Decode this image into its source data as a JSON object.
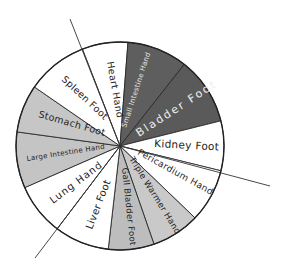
{
  "chart_data": {
    "type": "pie",
    "title": "",
    "center": [
      120,
      146
    ],
    "radius": 104,
    "segments": [
      {
        "label": "Heart Hand",
        "start": 248.8,
        "end": 274.4,
        "fill": "#ffffff",
        "text": "#222222"
      },
      {
        "label": "Small Intestine Hand",
        "start": 274.4,
        "end": 308.2,
        "fill": "#5e5e5e",
        "text": "#e8e8e8"
      },
      {
        "label": "Bladder Foot",
        "start": 308.2,
        "end": 346.0,
        "fill": "#5a5a5a",
        "text": "#eeeeee"
      },
      {
        "label": "Kidney Foot",
        "start": 346.0,
        "end": 373.8,
        "fill": "#ffffff",
        "text": "#222222"
      },
      {
        "label": "Pericardium Hand",
        "start": 373.8,
        "end": 403.8,
        "fill": "#ffffff",
        "text": "#222222"
      },
      {
        "label": "Triple Warmer Hand",
        "start": 403.8,
        "end": 430.9,
        "fill": "#c9c9c9",
        "text": "#222222"
      },
      {
        "label": "Gall Bladder Foot",
        "start": 430.9,
        "end": 456.5,
        "fill": "#bdbdbd",
        "text": "#222222"
      },
      {
        "label": "Liver Foot",
        "start": 456.5,
        "end": 487.2,
        "fill": "#ffffff",
        "text": "#222222"
      },
      {
        "label": "Lung Hand",
        "start": 487.2,
        "end": 516.4,
        "fill": "#ffffff",
        "text": "#222222"
      },
      {
        "label": "Large Intestine Hand",
        "start": 516.4,
        "end": 547.8,
        "fill": "#c4c4c4",
        "text": "#222222"
      },
      {
        "label": "Stomach Foot",
        "start": 547.8,
        "end": 574.6,
        "fill": "#c6c6c6",
        "text": "#222222"
      },
      {
        "label": "Spleen Foot",
        "start": 574.6,
        "end": 608.8,
        "fill": "#ffffff",
        "text": "#222222"
      }
    ],
    "extended_lines": [
      {
        "name": "top-left-axis",
        "from": [
          70,
          19
        ],
        "to": [
          120,
          146
        ]
      },
      {
        "name": "right-axis",
        "from": [
          120,
          146
        ],
        "to": [
          270,
          186
        ]
      },
      {
        "name": "bottom-left-axis",
        "from": [
          120,
          146
        ],
        "to": [
          35,
          258
        ]
      }
    ],
    "units": "degrees, 0 = right, clockwise"
  },
  "labels": {
    "heart": "Heart Hand",
    "small_intestine": "Small Intestine Hand",
    "bladder": "Bladder Foot",
    "kidney": "Kidney Foot",
    "pericardium": "Pericardium Hand",
    "triple_warmer": "Triple Warmer Hand",
    "gall_bladder": "Gall Bladder Foot",
    "liver": "Liver Foot",
    "lung": "Lung Hand",
    "large_intestine": "Large Intestine Hand",
    "stomach": "Stomach Foot",
    "spleen": "Spleen Foot"
  }
}
